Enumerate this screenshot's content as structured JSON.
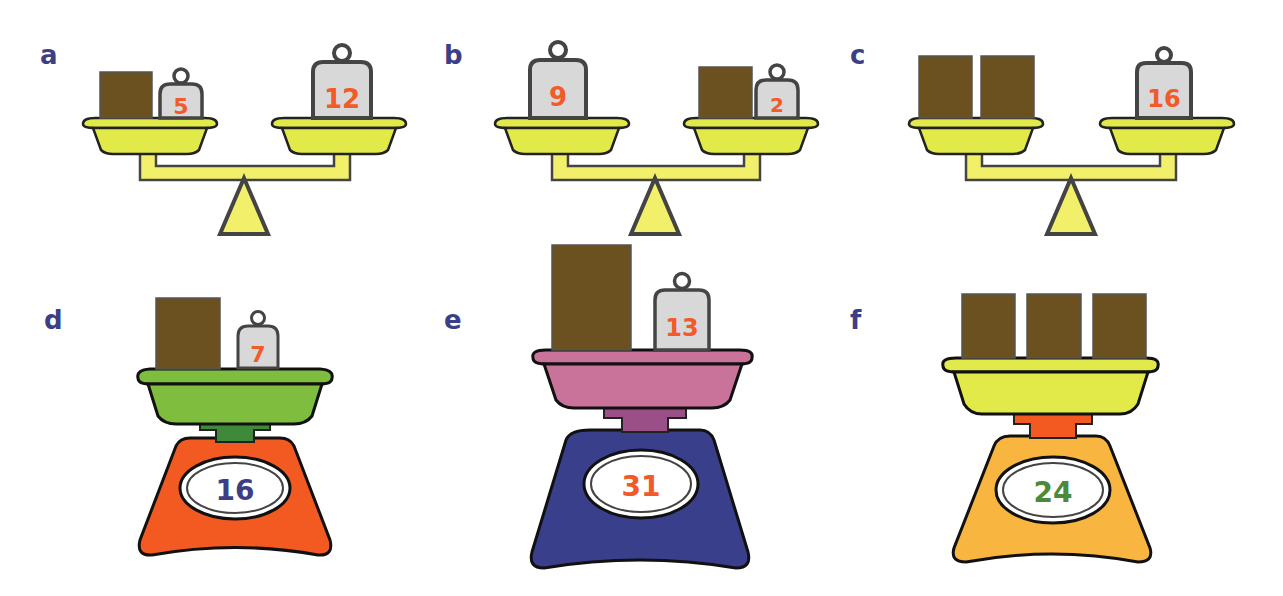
{
  "colors": {
    "label": "#3d3f86",
    "box": "#6b5020",
    "weight_fill": "#d8d8d8",
    "weight_text": "#f25a2a",
    "outline": "#3a3a3a",
    "balance_yellow": "#e2ea4a",
    "beam_yellow": "#f2ef6a",
    "d_pan": "#7fbd3f",
    "d_neck": "#3f8a3a",
    "d_base": "#f25a22",
    "d_display_text": "#3d3f86",
    "e_pan": "#c9729a",
    "e_neck": "#9a4f86",
    "e_base": "#3a3f8c",
    "e_display_text": "#f25a2a",
    "f_pan": "#e2ea4a",
    "f_neck": "#f25a22",
    "f_base": "#f8b540",
    "f_display_text": "#4a8a3a"
  },
  "panels": {
    "a": {
      "label": "a",
      "type": "balance",
      "left": {
        "boxes": 1,
        "weights": [
          "5"
        ]
      },
      "right": {
        "boxes": 0,
        "weights": [
          "12"
        ]
      }
    },
    "b": {
      "label": "b",
      "type": "balance",
      "left": {
        "boxes": 0,
        "weights": [
          "9"
        ]
      },
      "right": {
        "boxes": 1,
        "weights": [
          "2"
        ]
      }
    },
    "c": {
      "label": "c",
      "type": "balance",
      "left": {
        "boxes": 2,
        "weights": []
      },
      "right": {
        "boxes": 0,
        "weights": [
          "16"
        ]
      }
    },
    "d": {
      "label": "d",
      "type": "kitchen-scale",
      "boxes": 1,
      "weights": [
        "7"
      ],
      "reading": "16"
    },
    "e": {
      "label": "e",
      "type": "kitchen-scale",
      "boxes": 1,
      "weights": [
        "13"
      ],
      "reading": "31"
    },
    "f": {
      "label": "f",
      "type": "kitchen-scale",
      "boxes": 3,
      "weights": [],
      "reading": "24"
    }
  }
}
